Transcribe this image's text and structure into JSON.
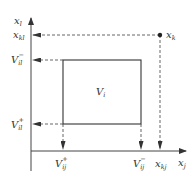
{
  "diagram": {
    "colors": {
      "stroke": "#444444",
      "dashed": "#555555",
      "text": "#333333",
      "background": "#ffffff"
    },
    "axes": {
      "y_label": {
        "base": "x",
        "sub": "l"
      },
      "x_label": {
        "base": "x",
        "sub": "j"
      }
    },
    "point": {
      "label": {
        "base": "x",
        "sub": "k"
      }
    },
    "y_ticks": [
      {
        "base": "x",
        "sub": "kl",
        "sup": ""
      },
      {
        "base": "V",
        "sub": "il",
        "sup": "−"
      },
      {
        "base": "V",
        "sub": "il",
        "sup": "+"
      }
    ],
    "x_ticks": [
      {
        "base": "V",
        "sub": "ij",
        "sup": "+"
      },
      {
        "base": "V",
        "sub": "ij",
        "sup": "−"
      },
      {
        "base": "x",
        "sub": "kj",
        "sup": ""
      }
    ],
    "region": {
      "base": "V",
      "sub": "i"
    }
  }
}
